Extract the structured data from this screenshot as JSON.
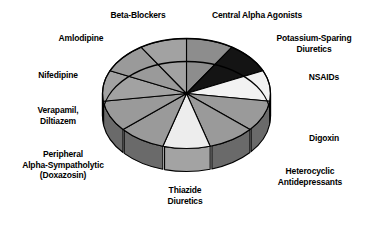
{
  "chart_data": {
    "type": "pie",
    "title": "",
    "subtitle": "",
    "xlabel": "",
    "ylabel": "",
    "legend_position": "callout-labels",
    "grid": false,
    "style": "3d-cylinder-pie",
    "note": "Eleven equal-sized wedges, grayscale fills, labeled with external callout text.",
    "categories": [
      "Central Alpha Agonists",
      "Potassium-Sparing Diuretics",
      "NSAIDs",
      "Digoxin",
      "Heterocyclic Antidepressants",
      "Thiazide Diuretics",
      "Peripheral Alpha-Sympatholytic (Doxazosin)",
      "Verapamil, Diltiazem",
      "Nifedipine",
      "Amlodipine",
      "Beta-Blockers"
    ],
    "values": [
      9.09,
      9.09,
      9.09,
      9.09,
      9.09,
      9.09,
      9.09,
      9.09,
      9.09,
      9.09,
      9.09
    ],
    "colors": [
      "#8d8d8d",
      "#141414",
      "#f2f2f2",
      "#9a9a9a",
      "#9a9a9a",
      "#ededed",
      "#9a9a9a",
      "#9a9a9a",
      "#a2a2a2",
      "#9a9a9a",
      "#a2a2a2"
    ],
    "side_colors": [
      "#5f5f5f",
      "#0d0d0d",
      "#a8a8a8",
      "#6a6a6a",
      "#6a6a6a",
      "#a3a3a3",
      "#6a6a6a",
      "#6a6a6a",
      "#707070",
      "#6a6a6a",
      "#707070"
    ],
    "slice_start_angles_deg": [
      0,
      32.7,
      65.5,
      98.2,
      130.9,
      163.6,
      196.4,
      229.1,
      261.8,
      294.5,
      327.3
    ]
  },
  "chart": {
    "outline_color": "#000000",
    "background": "#ffffff"
  },
  "labels": {
    "beta_blockers": "Beta-Blockers",
    "central_alpha_agonists": "Central Alpha Agonists",
    "potassium_sparing_diuretics": "Potassium-Sparing\nDiuretics",
    "nsaids": "NSAIDs",
    "digoxin": "Digoxin",
    "heterocyclic_antidepressants": "Heterocyclic\nAntidepressants",
    "thiazide_diuretics": "Thiazide\nDiuretics",
    "peripheral_alpha_sympatholytic": "Peripheral\nAlpha-Sympatholytic\n(Doxazosin)",
    "verapamil_diltiazem": "Verapamil,\nDiltiazem",
    "nifedipine": "Nifedipine",
    "amlodipine": "Amlodipine"
  }
}
